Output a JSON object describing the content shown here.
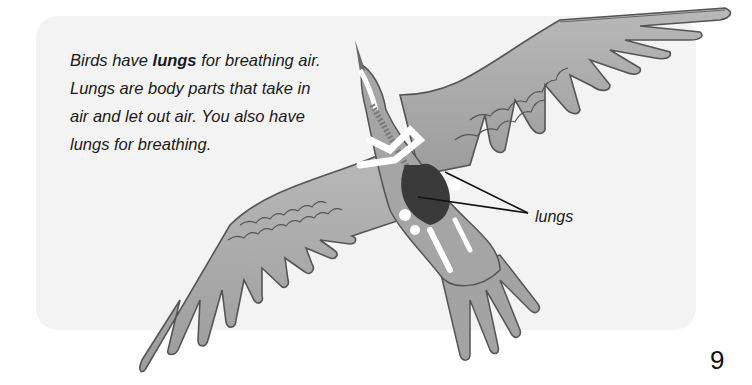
{
  "page": {
    "paragraph": {
      "part1": "Birds have ",
      "bold": "lungs",
      "part2": " for breathing air. Lungs are body parts that take in air and let out air. You also have lungs for breathing."
    },
    "illustration": {
      "subject": "bird seen from below showing skeleton and lungs",
      "label": "lungs"
    },
    "page_number": "9"
  },
  "colors": {
    "panel": "#f3f3f3",
    "feather": "#a9a9a9",
    "feather_outline": "#555555",
    "lungs": "#3a3a3a",
    "bones": "#ffffff"
  }
}
